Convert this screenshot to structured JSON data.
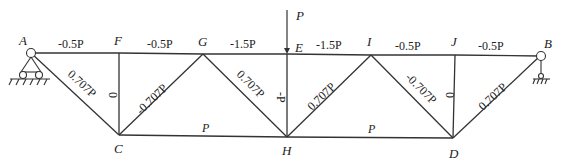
{
  "diagram": {
    "type": "truss",
    "load": {
      "label": "P",
      "node": "E",
      "direction": "down"
    },
    "nodes": {
      "A": {
        "label": "A"
      },
      "F": {
        "label": "F"
      },
      "G": {
        "label": "G"
      },
      "E": {
        "label": "E"
      },
      "I": {
        "label": "I"
      },
      "J": {
        "label": "J"
      },
      "B": {
        "label": "B"
      },
      "C": {
        "label": "C"
      },
      "H": {
        "label": "H"
      },
      "D": {
        "label": "D"
      }
    },
    "supports": {
      "A": "roller-support",
      "B": "pin-support"
    },
    "members": {
      "AF": "-0.5P",
      "FG": "-0.5P",
      "GE": "-1.5P",
      "EI": "-1.5P",
      "IJ": "-0.5P",
      "JB": "-0.5P",
      "AC": "0.707P",
      "FC": "0",
      "CG": "-0.707P",
      "GH": "0.707P",
      "EH": "-P",
      "HI": "0.707P",
      "ID": "-0.707P",
      "JD": "0",
      "DB": "0.707P",
      "CH": "P",
      "HD": "P"
    }
  }
}
